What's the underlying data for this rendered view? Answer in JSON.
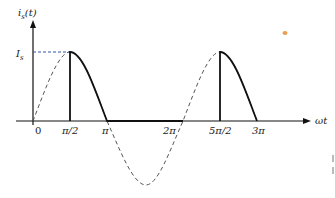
{
  "diagram": {
    "y_axis_label": "i_s(t)",
    "y_axis_label_main": "i",
    "y_axis_label_sub": "s",
    "y_axis_label_arg": "(t)",
    "x_axis_label": "ωt",
    "peak_label_main": "I",
    "peak_label_sub": "s",
    "ticks": [
      "0",
      "π/2",
      "π",
      "2π",
      "5π/2",
      "3π"
    ],
    "colors": {
      "line": "#111111",
      "dashed": "#555555",
      "peak_guide": "#3355aa",
      "dot": "#e8a050"
    }
  }
}
